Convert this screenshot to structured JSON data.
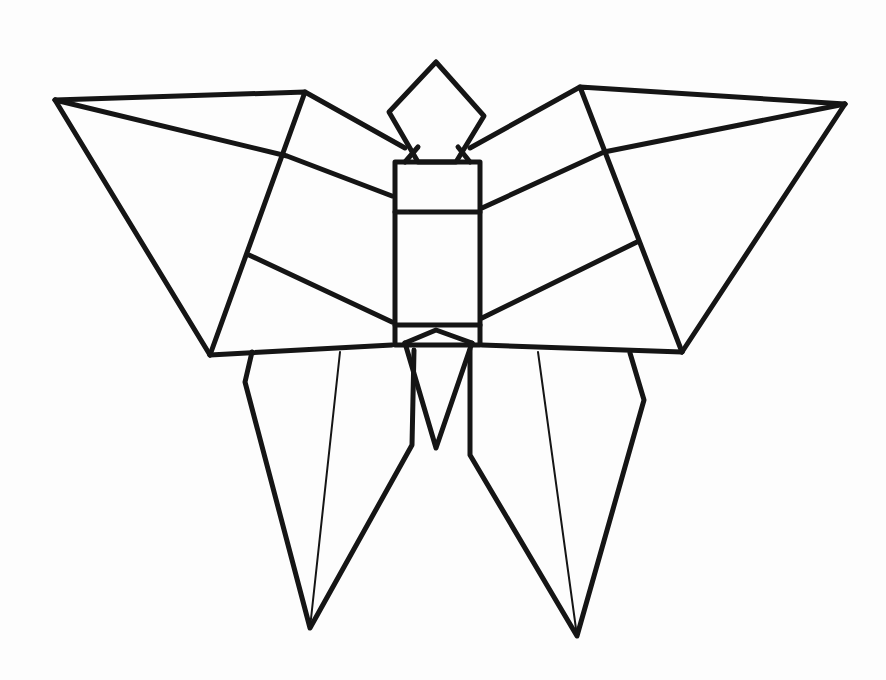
{
  "figure": {
    "width": 886,
    "height": 680,
    "background": "#fdfdfd",
    "stroke_color": "#151515",
    "parts": {
      "left_upper_wing": {
        "polylines": [
          [
            [
              55,
              100
            ],
            [
              305,
              92
            ],
            [
              210,
              355
            ]
          ],
          [
            [
              55,
              100
            ],
            [
              210,
              355
            ]
          ],
          [
            [
              55,
              100
            ],
            [
              287,
              156
            ],
            [
              392,
              196
            ]
          ],
          [
            [
              305,
              92
            ],
            [
              405,
              148
            ]
          ],
          [
            [
              249,
              255
            ],
            [
              392,
              322
            ]
          ],
          [
            [
              210,
              355
            ],
            [
              392,
              345
            ]
          ]
        ]
      },
      "right_upper_wing": {
        "polylines": [
          [
            [
              845,
              104
            ],
            [
              580,
              87
            ],
            [
              682,
              352
            ]
          ],
          [
            [
              845,
              104
            ],
            [
              682,
              352
            ]
          ],
          [
            [
              845,
              104
            ],
            [
              604,
              152
            ],
            [
              482,
              208
            ]
          ],
          [
            [
              580,
              87
            ],
            [
              470,
              148
            ]
          ],
          [
            [
              637,
              242
            ],
            [
              482,
              318
            ]
          ],
          [
            [
              682,
              352
            ],
            [
              482,
              345
            ]
          ]
        ]
      },
      "head": {
        "polylines": [
          [
            [
              436,
              62
            ],
            [
              484,
              116
            ],
            [
              456,
              162
            ],
            [
              418,
              162
            ],
            [
              389,
              112
            ],
            [
              436,
              62
            ]
          ],
          [
            [
              405,
              162
            ],
            [
              418,
              147
            ]
          ],
          [
            [
              470,
              162
            ],
            [
              458,
              147
            ]
          ]
        ]
      },
      "body": {
        "polylines": [
          [
            [
              395,
              162
            ],
            [
              480,
              162
            ],
            [
              480,
              345
            ],
            [
              395,
              345
            ],
            [
              395,
              162
            ]
          ],
          [
            [
              395,
              212
            ],
            [
              480,
              212
            ]
          ],
          [
            [
              395,
              325
            ],
            [
              480,
              325
            ]
          ]
        ]
      },
      "tail": {
        "polylines": [
          [
            [
              405,
              343
            ],
            [
              436,
              330
            ],
            [
              472,
              343
            ]
          ],
          [
            [
              405,
              343
            ],
            [
              436,
              448
            ],
            [
              472,
              343
            ]
          ]
        ]
      },
      "left_lower_wing": {
        "polylines": [
          [
            [
              252,
              352
            ],
            [
              245,
              382
            ],
            [
              310,
              628
            ],
            [
              412,
              445
            ],
            [
              414,
              350
            ]
          ],
          [
            [
              340,
              352
            ],
            [
              310,
              628
            ]
          ]
        ],
        "fold_line_thin": true
      },
      "right_lower_wing": {
        "polylines": [
          [
            [
              630,
              353
            ],
            [
              644,
              400
            ],
            [
              577,
              636
            ],
            [
              470,
              455
            ],
            [
              470,
              350
            ]
          ],
          [
            [
              538,
              352
            ],
            [
              577,
              636
            ]
          ]
        ],
        "fold_line_thin": true
      }
    }
  }
}
